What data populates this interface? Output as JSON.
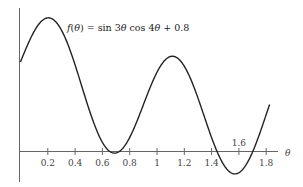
{
  "chart_data": {
    "type": "line",
    "title": "",
    "annotation": "f(θ) = sin 3θ cos 4θ + 0.8",
    "function": "sin(3*theta)*cos(4*theta)+0.8",
    "xlabel": "θ",
    "ylabel": "",
    "xlim": [
      0,
      1.82
    ],
    "ylim": [
      -0.25,
      1.3
    ],
    "grid": false,
    "legend": null,
    "x_ticks": [
      0.2,
      0.4,
      0.6,
      0.8,
      1,
      1.2,
      1.4,
      1.6,
      1.8
    ],
    "x_tick_labels": [
      "0.2",
      "0.4",
      "0.6",
      "0.8",
      "1",
      "1.2",
      "1.4",
      "1.6",
      "1.8"
    ],
    "x_tick_label_above": [
      "1.6"
    ],
    "series": [
      {
        "name": "f(θ)",
        "x": [
          0,
          0.1,
          0.2,
          0.3,
          0.4,
          0.5,
          0.6,
          0.7,
          0.8,
          0.9,
          1.0,
          1.1,
          1.2,
          1.3,
          1.4,
          1.5,
          1.6,
          1.7,
          1.8
        ],
        "values": [
          0.8,
          1.08,
          1.19,
          1.08,
          0.8,
          0.51,
          0.17,
          0.0,
          0.1,
          0.4,
          0.7,
          0.94,
          0.88,
          0.55,
          0.07,
          -0.19,
          -0.2,
          0.04,
          0.55
        ]
      }
    ]
  },
  "labels": {
    "formula": "f(θ) = sin 3θ cos 4θ + 0.8",
    "x_axis": "θ",
    "ticks": [
      "0.2",
      "0.4",
      "0.6",
      "0.8",
      "1",
      "1.2",
      "1.4",
      "1.6",
      "1.8"
    ]
  }
}
